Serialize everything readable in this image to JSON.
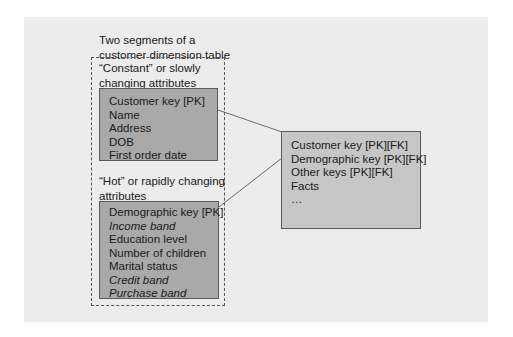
{
  "diagram": {
    "caption_line1": "Two segments of a",
    "caption_line2": "customer dimension table",
    "constant_segment": {
      "label_line1": "“Constant” or slowly",
      "label_line2": "changing attributes",
      "rows": [
        {
          "text": "Customer key [PK]",
          "italic": false
        },
        {
          "text": "Name",
          "italic": false
        },
        {
          "text": "Address",
          "italic": false
        },
        {
          "text": "DOB",
          "italic": false
        },
        {
          "text": "First order date",
          "italic": false
        }
      ]
    },
    "hot_segment": {
      "label_line1": "“Hot” or rapidly changing",
      "label_line2": "attributes",
      "rows": [
        {
          "text": "Demographic key [PK]",
          "italic": false
        },
        {
          "text": "Income band",
          "italic": true
        },
        {
          "text": "Education level",
          "italic": false
        },
        {
          "text": "Number of children",
          "italic": false
        },
        {
          "text": "Marital status",
          "italic": false
        },
        {
          "text": "Credit band",
          "italic": true
        },
        {
          "text": "Purchase band",
          "italic": true
        }
      ]
    },
    "fact_table": {
      "rows": [
        {
          "text": "Customer key [PK][FK]"
        },
        {
          "text": "Demographic key [PK][FK]"
        },
        {
          "text": "Other keys [PK][FK]"
        },
        {
          "text": "Facts"
        },
        {
          "text": "…"
        }
      ]
    },
    "colors": {
      "panel": "#ececec",
      "dimension_box": "#a9a9a9",
      "fact_box": "#c6c6c6",
      "connector": "#6a6a6a"
    }
  }
}
